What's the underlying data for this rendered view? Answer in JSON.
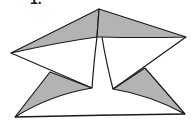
{
  "figure": {
    "label": "1.",
    "colors": {
      "stroke": "#1a1a1a",
      "shade": "#b3b3b3",
      "fill": "#ffffff"
    },
    "shapes": {
      "top_left_flap": "11,53 99,9 97,37",
      "top_right_flap": "99,9 186,37 102,37",
      "bottom_left_flap": "50,72 92,88 15,117",
      "bottom_right_flap": "145,68 185,114 113,89",
      "outline": "11,53 99,9 186,37 113,89 185,114 15,117 92,88"
    }
  }
}
